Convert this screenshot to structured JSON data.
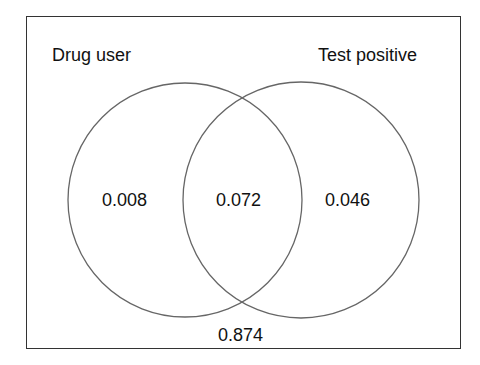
{
  "diagram": {
    "type": "venn",
    "sets": [
      {
        "name": "Drug user",
        "label": "Drug user"
      },
      {
        "name": "Test positive",
        "label": "Test positive"
      }
    ],
    "regions": {
      "drug_user_only": "0.008",
      "intersection": "0.072",
      "test_positive_only": "0.046",
      "outside": "0.874"
    },
    "colors": {
      "stroke": "#666666",
      "frame": "#333333",
      "text": "#111111"
    }
  }
}
